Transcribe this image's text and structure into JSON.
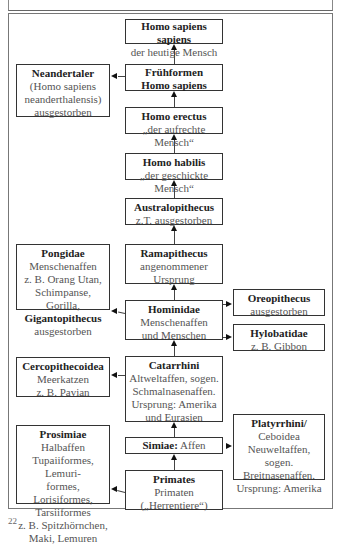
{
  "diagram": {
    "nodes": {
      "homo_sapiens_sapiens": {
        "title": "Homo sapiens sapiens",
        "lines": [
          "der heutige Mensch"
        ]
      },
      "fruehformen": {
        "title": "Frühformen",
        "title2": "Homo sapiens"
      },
      "neandertaler": {
        "title": "Neandertaler",
        "lines": [
          "(Homo sapiens",
          "neanderthalensis)",
          "ausgestorben"
        ]
      },
      "homo_erectus": {
        "title": "Homo erectus",
        "lines": [
          "„der aufrechte Mensch“"
        ]
      },
      "homo_habilis": {
        "title": "Homo habilis",
        "lines": [
          "„der geschickte Mensch“"
        ]
      },
      "australopithecus": {
        "title": "Australopithecus",
        "lines": [
          "z.T. ausgestorben"
        ]
      },
      "ramapithecus": {
        "title": "Ramapithecus",
        "lines": [
          "angenommener",
          "Ursprung"
        ]
      },
      "pongidae": {
        "title": "Pongidae",
        "lines": [
          "Menschenaffen",
          "z. B. Orang Utan,",
          "Schimpanse, Gorilla,"
        ],
        "title2": "Gigantopithecus",
        "lines2": [
          "ausgestorben"
        ]
      },
      "hominidae": {
        "title": "Hominidae",
        "lines": [
          "Menschenaffen",
          "und Menschen"
        ]
      },
      "oreopithecus": {
        "title": "Oreopithecus",
        "lines": [
          "ausgestorben"
        ]
      },
      "hylobatidae": {
        "title": "Hylobatidae",
        "lines": [
          "z. B. Gibbon"
        ]
      },
      "cercopithecoidea": {
        "title": "Cercopithecoidea",
        "lines": [
          "Meerkatzen",
          "z. B. Pavian"
        ]
      },
      "catarrhini": {
        "title": "Catarrhini",
        "lines": [
          "Altweltaffen, sogen.",
          "Schmalnasenaffen.",
          "Ursprung: Amerika",
          "und Eurasien"
        ]
      },
      "simiae": {
        "title": "Simiae:",
        "suffix": " Affen"
      },
      "platyrrhini": {
        "title": "Platyrrhini/",
        "lines": [
          "Ceboidea",
          "Neuweltaffen, sogen.",
          "Breitnasenaffen.",
          "Ursprung: Amerika"
        ]
      },
      "prosimiae": {
        "title": "Prosimiae",
        "lines": [
          "Halbaffen",
          "Tupaiiformes, Lemuri-",
          "formes, Lorisiformes,",
          "Tarsiiformes",
          "z. B. Spitzhörnchen,",
          "Maki, Lemuren"
        ]
      },
      "primates": {
        "title": "Primates",
        "lines": [
          "Primaten",
          "(„Herrentiere“)"
        ]
      }
    },
    "caption": "22"
  }
}
